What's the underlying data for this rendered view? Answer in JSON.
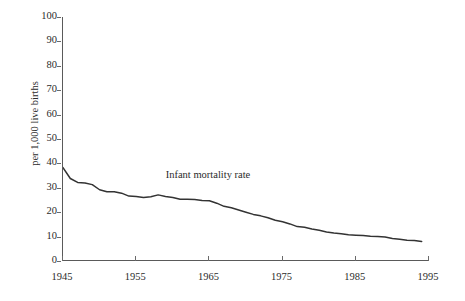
{
  "chart_data": {
    "type": "line",
    "title": "",
    "subtitle": "",
    "xlabel": "",
    "ylabel": "per 1,000 live births",
    "xlim": [
      1945,
      1995
    ],
    "ylim": [
      0,
      100
    ],
    "grid": false,
    "legend_position": "none",
    "annotations": [
      {
        "text": "Infant mortality rate",
        "x": 1966,
        "y": 35
      }
    ],
    "xticks": [
      1945,
      1955,
      1965,
      1975,
      1985,
      1995
    ],
    "xtick_labels": [
      "1945",
      "1955",
      "1965",
      "1975",
      "1985",
      "1995"
    ],
    "yticks": [
      0,
      10,
      20,
      30,
      40,
      50,
      60,
      70,
      80,
      90,
      100
    ],
    "ytick_labels": [
      "0",
      "10",
      "20",
      "30",
      "40",
      "50",
      "60",
      "70",
      "80",
      "90",
      "100"
    ],
    "series": [
      {
        "name": "Infant mortality rate",
        "color": "#333333",
        "x": [
          1945,
          1946,
          1947,
          1948,
          1949,
          1950,
          1951,
          1952,
          1953,
          1954,
          1955,
          1956,
          1957,
          1958,
          1959,
          1960,
          1961,
          1962,
          1963,
          1964,
          1965,
          1966,
          1967,
          1968,
          1969,
          1970,
          1971,
          1972,
          1973,
          1974,
          1975,
          1976,
          1977,
          1978,
          1979,
          1980,
          1981,
          1982,
          1983,
          1984,
          1985,
          1986,
          1987,
          1988,
          1989,
          1990,
          1991,
          1992,
          1993,
          1994
        ],
        "values": [
          38.3,
          33.8,
          32.2,
          32.0,
          31.3,
          29.2,
          28.4,
          28.4,
          27.8,
          26.6,
          26.4,
          26.0,
          26.3,
          27.1,
          26.4,
          26.0,
          25.3,
          25.3,
          25.2,
          24.8,
          24.7,
          23.7,
          22.4,
          21.8,
          20.9,
          20.0,
          19.1,
          18.5,
          17.7,
          16.7,
          16.1,
          15.2,
          14.1,
          13.8,
          13.1,
          12.6,
          11.9,
          11.5,
          11.2,
          10.8,
          10.6,
          10.4,
          10.1,
          10.0,
          9.8,
          9.2,
          8.9,
          8.5,
          8.4,
          8.0
        ]
      }
    ]
  }
}
